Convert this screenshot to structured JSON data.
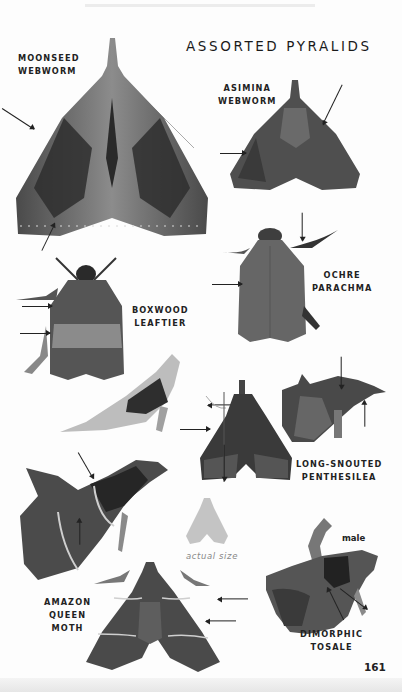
{
  "page": {
    "title": "ASSORTED PYRALIDS",
    "page_number": "161",
    "color_mode": "grayscale",
    "colors": {
      "text": "#1a1a1a",
      "background": "#fdfdfd",
      "silhouette": "#c4c4c4"
    }
  },
  "species": [
    {
      "id": "moonseed-webworm",
      "label_lines": [
        "MOONSEED",
        "WEBWORM"
      ],
      "arrows": 2
    },
    {
      "id": "asimina-webworm",
      "label_lines": [
        "ASIMINA",
        "WEBWORM"
      ],
      "arrows": 2
    },
    {
      "id": "ochre-parachma",
      "label_lines": [
        "OCHRE",
        "PARACHMA"
      ],
      "arrows": 2
    },
    {
      "id": "boxwood-leaftier",
      "label_lines": [
        "BOXWOOD",
        "LEAFTIER"
      ],
      "arrows": 2
    },
    {
      "id": "long-snouted-penthesilea",
      "label_lines": [
        "LONG-SNOUTED",
        "PENTHESILEA"
      ],
      "arrows": 5
    },
    {
      "id": "amazon-queen-moth",
      "label_lines": [
        "AMAZON",
        "QUEEN",
        "MOTH"
      ],
      "arrows": 4
    },
    {
      "id": "dimorphic-tosale",
      "label_lines": [
        "DIMORPHIC",
        "TOSALE"
      ],
      "arrows": 2,
      "note": "male"
    }
  ],
  "annotations": {
    "actual_size": "actual size",
    "male": "male"
  }
}
